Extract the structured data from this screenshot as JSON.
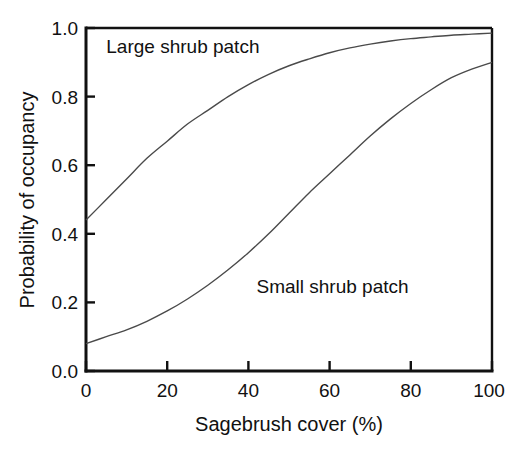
{
  "chart_data": {
    "type": "line",
    "title": "",
    "xlabel": "Sagebrush cover (%)",
    "ylabel": "Probability of occupancy",
    "xlim": [
      0,
      100
    ],
    "ylim": [
      0.0,
      1.0
    ],
    "grid": false,
    "legend_position": "inline-annotations",
    "xticks": [
      "0",
      "20",
      "40",
      "60",
      "80",
      "100"
    ],
    "xtick_values": [
      0,
      20,
      40,
      60,
      80,
      100
    ],
    "yticks": [
      "0.0",
      "0.2",
      "0.4",
      "0.6",
      "0.8",
      "1.0"
    ],
    "ytick_values": [
      0.0,
      0.2,
      0.4,
      0.6,
      0.8,
      1.0
    ],
    "x": [
      0,
      5,
      10,
      15,
      20,
      25,
      30,
      35,
      40,
      45,
      50,
      55,
      60,
      65,
      70,
      75,
      80,
      85,
      90,
      95,
      100
    ],
    "series": [
      {
        "name": "Large shrub patch",
        "color": "#4a4a4a",
        "label_text": "Large shrub patch",
        "values": [
          0.44,
          0.5,
          0.56,
          0.62,
          0.67,
          0.72,
          0.76,
          0.8,
          0.835,
          0.865,
          0.89,
          0.91,
          0.928,
          0.942,
          0.953,
          0.962,
          0.969,
          0.974,
          0.979,
          0.982,
          0.985
        ]
      },
      {
        "name": "Small shrub patch",
        "color": "#4a4a4a",
        "label_text": "Small shrub patch",
        "values": [
          0.08,
          0.1,
          0.12,
          0.145,
          0.175,
          0.21,
          0.25,
          0.295,
          0.345,
          0.4,
          0.46,
          0.52,
          0.575,
          0.63,
          0.685,
          0.735,
          0.78,
          0.82,
          0.855,
          0.88,
          0.9
        ]
      }
    ],
    "annotations": [
      {
        "text": "Large shrub patch",
        "x": 5,
        "y": 0.945
      },
      {
        "text": "Small shrub patch",
        "x": 42,
        "y": 0.245
      }
    ]
  }
}
